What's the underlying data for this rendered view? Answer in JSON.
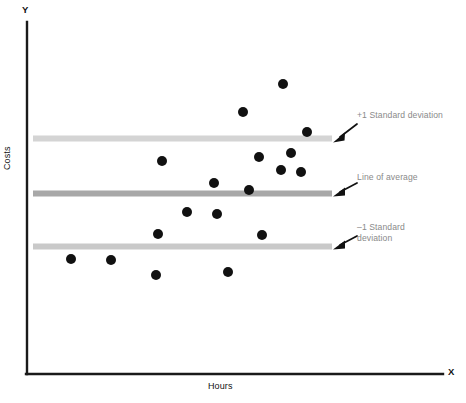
{
  "figure": {
    "kind": "scatter-plot-with-bands",
    "background": "#ffffff"
  },
  "axes": {
    "y_letter": "Y",
    "x_letter": "X",
    "y_title": "Costs",
    "x_title": "Hours",
    "axis_color": "#1a1a1a"
  },
  "annotations": {
    "plus_sd": "+1 Standard deviation",
    "average": "Line of average",
    "minus_sd": "–1 Standard\ndeviation",
    "text_color": "#8a8a8a"
  },
  "bands": {
    "plus_sd_color": "#d4d4d4",
    "average_color": "#a8a8a8",
    "minus_sd_color": "#c9c9c9"
  },
  "chart_data": {
    "type": "scatter",
    "title": "",
    "xlabel": "Hours",
    "ylabel": "Costs",
    "xlim": [
      0,
      100
    ],
    "ylim": [
      0,
      100
    ],
    "grid": false,
    "legend": "none",
    "axis_letters": {
      "x": "X",
      "y": "Y"
    },
    "point_color": "#111111",
    "point_radius_px": 5,
    "points_px": [
      {
        "x": 283,
        "y": 84
      },
      {
        "x": 243,
        "y": 112
      },
      {
        "x": 307,
        "y": 132
      },
      {
        "x": 291,
        "y": 153
      },
      {
        "x": 259,
        "y": 157
      },
      {
        "x": 162,
        "y": 161
      },
      {
        "x": 281,
        "y": 170
      },
      {
        "x": 301,
        "y": 172
      },
      {
        "x": 214,
        "y": 183
      },
      {
        "x": 249,
        "y": 190
      },
      {
        "x": 187,
        "y": 212
      },
      {
        "x": 217,
        "y": 214
      },
      {
        "x": 158,
        "y": 234
      },
      {
        "x": 262,
        "y": 235
      },
      {
        "x": 71,
        "y": 259
      },
      {
        "x": 111,
        "y": 260
      },
      {
        "x": 156,
        "y": 275
      },
      {
        "x": 228,
        "y": 272
      }
    ],
    "reference_lines": [
      {
        "name": "+1 Standard deviation",
        "y_px": 138.5,
        "x_start_px": 33,
        "x_end_px": 332,
        "color": "#d4d4d4",
        "thickness_px": 6
      },
      {
        "name": "Line of average",
        "y_px": 193.5,
        "x_start_px": 33,
        "x_end_px": 332,
        "color": "#a8a8a8",
        "thickness_px": 6
      },
      {
        "name": "–1 Standard deviation",
        "y_px": 246.5,
        "x_start_px": 33,
        "x_end_px": 332,
        "color": "#c9c9c9",
        "thickness_px": 6
      }
    ],
    "axis_geometry_px": {
      "origin": {
        "x": 27,
        "y": 374
      },
      "y_axis_top": {
        "x": 27,
        "y": 22
      },
      "x_axis_right": {
        "x": 443,
        "y": 374
      }
    },
    "callout_arrows_px": [
      {
        "target": "+1 Standard deviation",
        "from": {
          "x": 357,
          "y": 124
        },
        "to": {
          "x": 334,
          "y": 140
        }
      },
      {
        "target": "Line of average",
        "from": {
          "x": 357,
          "y": 183
        },
        "to": {
          "x": 334,
          "y": 195
        }
      },
      {
        "target": "–1 Standard deviation",
        "from": {
          "x": 357,
          "y": 236
        },
        "to": {
          "x": 334,
          "y": 248
        }
      }
    ]
  }
}
